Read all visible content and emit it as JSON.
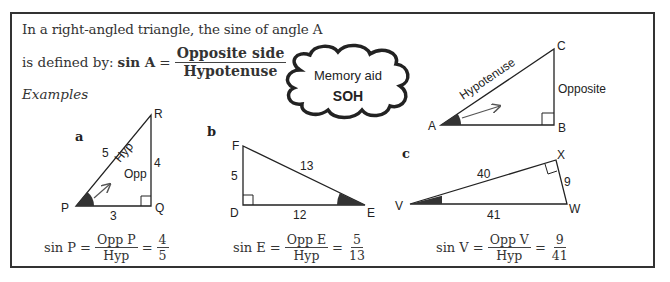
{
  "intro": {
    "line1": "In a right-angled triangle, the sine of angle A",
    "line2_prefix": "is defined by:",
    "lhs": "sin A",
    "equals": "=",
    "numerator": "Opposite side",
    "denominator": "Hypotenuse"
  },
  "memory_aid": {
    "label": "Memory aid",
    "mnemonic": "SOH"
  },
  "main_triangle": {
    "vertices": {
      "A": "A",
      "B": "B",
      "C": "C"
    },
    "hypotenuse_label": "Hypotenuse",
    "opposite_label": "Opposite"
  },
  "examples_heading": "Examples",
  "examples": [
    {
      "tag": "a",
      "vertices": {
        "angle": "P",
        "right": "Q",
        "other": "R"
      },
      "sides": {
        "hyp": "5",
        "opp": "4",
        "adj": "3"
      },
      "side_labels": {
        "hyp": "Hyp",
        "opp": "Opp"
      },
      "formula": {
        "lhs": "sin P",
        "num": "Opp P",
        "den": "Hyp",
        "val_num": "4",
        "val_den": "5"
      }
    },
    {
      "tag": "b",
      "vertices": {
        "angle": "E",
        "right": "D",
        "other": "F"
      },
      "sides": {
        "hyp": "13",
        "opp": "5",
        "adj": "12"
      },
      "formula": {
        "lhs": "sin E",
        "num": "Opp E",
        "den": "Hyp",
        "val_num": "5",
        "val_den": "13"
      }
    },
    {
      "tag": "c",
      "vertices": {
        "angle": "V",
        "right": "X",
        "other": "W"
      },
      "sides": {
        "hyp": "41",
        "opp": "9",
        "adj": "40"
      },
      "formula": {
        "lhs": "sin V",
        "num": "Opp V",
        "den": "Hyp",
        "val_num": "9",
        "val_den": "41"
      }
    }
  ],
  "eq": "="
}
